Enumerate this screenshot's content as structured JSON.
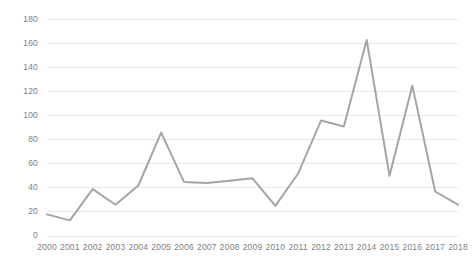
{
  "chart_data": {
    "type": "line",
    "title": "",
    "subtitle": "",
    "xlabel": "",
    "ylabel": "",
    "categories": [
      "2000",
      "2001",
      "2002",
      "2003",
      "2004",
      "2005",
      "2006",
      "2007",
      "2008",
      "2009",
      "2010",
      "2011",
      "2012",
      "2013",
      "2014",
      "2015",
      "2016",
      "2017",
      "2018"
    ],
    "x": [
      2000,
      2001,
      2002,
      2003,
      2004,
      2005,
      2006,
      2007,
      2008,
      2009,
      2010,
      2011,
      2012,
      2013,
      2014,
      2015,
      2016,
      2017,
      2018
    ],
    "values": [
      18,
      13,
      39,
      26,
      42,
      86,
      45,
      44,
      46,
      48,
      25,
      52,
      96,
      91,
      163,
      50,
      125,
      37,
      26
    ],
    "series": [
      {
        "name": "series-1",
        "values": [
          18,
          13,
          39,
          26,
          42,
          86,
          45,
          44,
          46,
          48,
          25,
          52,
          96,
          91,
          163,
          50,
          125,
          37,
          26
        ],
        "color": "#a5a5a5"
      }
    ],
    "ylim": [
      0,
      180
    ],
    "xlim": [
      2000,
      2018
    ],
    "yticks": [
      0,
      20,
      40,
      60,
      80,
      100,
      120,
      140,
      160,
      180
    ],
    "ytick_labels": [
      "0",
      "20",
      "40",
      "60",
      "80",
      "100",
      "120",
      "140",
      "160",
      "180"
    ],
    "xtick_labels": [
      "2000",
      "2001",
      "2002",
      "2003",
      "2004",
      "2005",
      "2006",
      "2007",
      "2008",
      "2009",
      "2010",
      "2011",
      "2012",
      "2013",
      "2014",
      "2015",
      "2016",
      "2017",
      "2018"
    ],
    "grid": true,
    "grid_axis": "y",
    "grid_color": "#e8e8e8",
    "legend": false,
    "legend_position": "none",
    "markers": false,
    "line_width": 2,
    "axis_label_color": "#808080",
    "background_color": "#ffffff"
  }
}
